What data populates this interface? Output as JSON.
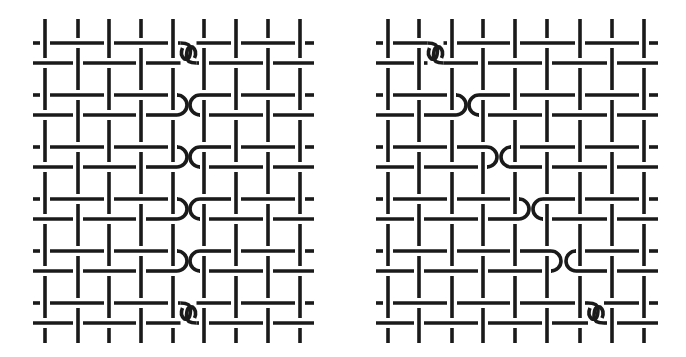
{
  "diagram": {
    "type": "weave-diagram",
    "stroke_color": "#1a1a1a",
    "background": "#ffffff",
    "panels": [
      {
        "name": "left-weave",
        "columns_x": [
          45,
          78,
          109,
          141,
          173,
          204,
          236,
          268,
          300
        ],
        "row_pairs_y": [
          [
            43,
            63
          ],
          [
            95,
            115
          ],
          [
            147,
            167
          ],
          [
            199,
            219
          ],
          [
            251,
            271
          ],
          [
            303,
            323
          ]
        ],
        "x_start": 33,
        "x_end": 314,
        "y_top": 19,
        "y_bottom": 343,
        "breaks": [
          {
            "row_pair": 0,
            "kind": "link",
            "left_col": 4,
            "right_col": 5
          },
          {
            "row_pair": 1,
            "kind": "turn",
            "left_col": 4,
            "right_col": 5
          },
          {
            "row_pair": 2,
            "kind": "turn",
            "left_col": 4,
            "right_col": 5
          },
          {
            "row_pair": 3,
            "kind": "turn",
            "left_col": 4,
            "right_col": 5
          },
          {
            "row_pair": 4,
            "kind": "turn",
            "left_col": 4,
            "right_col": 5
          },
          {
            "row_pair": 5,
            "kind": "link",
            "left_col": 4,
            "right_col": 5
          }
        ]
      },
      {
        "name": "right-weave",
        "columns_x": [
          388,
          419,
          452,
          483,
          515,
          547,
          580,
          612,
          644
        ],
        "row_pairs_y": [
          [
            43,
            63
          ],
          [
            95,
            115
          ],
          [
            147,
            167
          ],
          [
            199,
            219
          ],
          [
            251,
            271
          ],
          [
            303,
            323
          ]
        ],
        "x_start": 376,
        "x_end": 658,
        "y_top": 19,
        "y_bottom": 343,
        "breaks": [
          {
            "row_pair": 0,
            "kind": "link",
            "left_col": 1,
            "right_col": 2
          },
          {
            "row_pair": 1,
            "kind": "turn",
            "left_col": 2,
            "right_col": 3
          },
          {
            "row_pair": 2,
            "kind": "turn",
            "left_col": 3,
            "right_col": 4
          },
          {
            "row_pair": 3,
            "kind": "turn",
            "left_col": 4,
            "right_col": 5
          },
          {
            "row_pair": 4,
            "kind": "turn",
            "left_col": 5,
            "right_col": 6
          },
          {
            "row_pair": 5,
            "kind": "link",
            "left_col": 6,
            "right_col": 7
          }
        ]
      }
    ]
  }
}
